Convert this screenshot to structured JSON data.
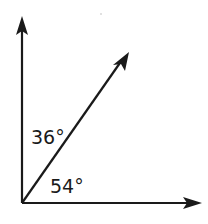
{
  "diagram": {
    "type": "angle-diagram",
    "rays": [
      {
        "name": "vertical-ray",
        "direction": "up"
      },
      {
        "name": "diagonal-ray",
        "direction": "up-right"
      },
      {
        "name": "horizontal-ray",
        "direction": "right"
      }
    ],
    "angles": {
      "upper": {
        "label": "36°",
        "between": [
          "vertical-ray",
          "diagonal-ray"
        ]
      },
      "lower": {
        "label": "54°",
        "between": [
          "diagonal-ray",
          "horizontal-ray"
        ]
      }
    },
    "colors": {
      "stroke": "#1a1a1a",
      "background": "#ffffff"
    }
  }
}
